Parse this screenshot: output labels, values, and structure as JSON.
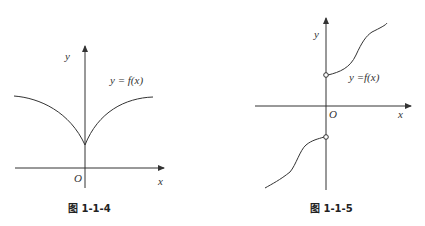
{
  "figures": [
    {
      "caption": "图 1-1-4",
      "function_label": "y = f(x)",
      "axis_x_label": "x",
      "axis_y_label": "y",
      "origin_label": "O",
      "description": "Even function, continuous, minimum cusp on the positive y-axis, increasing toward horizontal asymptote on both sides"
    },
    {
      "caption": "图 1-1-5",
      "function_label": "y =f(x)",
      "axis_x_label": "x",
      "axis_y_label": "y",
      "origin_label": "O",
      "description": "Odd function, discontinuous at x=0 with open circles on the positive and negative y-axis, increasing S-shaped branches"
    }
  ],
  "colors": {
    "stroke": "#333333",
    "background": "#ffffff"
  }
}
